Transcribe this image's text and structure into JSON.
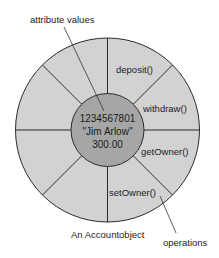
{
  "diagram": {
    "type": "object-diagram",
    "callouts": {
      "attributes": "attribute values",
      "operations": "operations"
    },
    "caption": "An Accountobject",
    "attribute_values": [
      "1234567801",
      "\"Jim Arlow\"",
      "300.00"
    ],
    "operations": [
      {
        "label": "deposit()"
      },
      {
        "label": "withdraw()"
      },
      {
        "label": "getOwner()"
      },
      {
        "label": "setOwner()"
      }
    ],
    "colors": {
      "outer_ring": "#d2d2d2",
      "inner_core": "#a6a6a6",
      "stroke": "#2b2b2b",
      "text": "#222222"
    }
  }
}
